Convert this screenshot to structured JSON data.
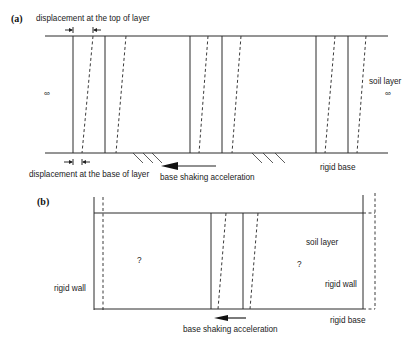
{
  "figure": {
    "panel_a": {
      "label": "(a)",
      "top_annotation": "displacement at the top of layer",
      "base_annotation": "displacement at the base of layer",
      "soil_layer_label": "soil layer",
      "infinity_left": "∞",
      "infinity_right": "∞",
      "arrow_label": "base shaking acceleration",
      "rigid_base_label": "rigid base",
      "columns": [
        {
          "solid_x": 73,
          "dash_top_x": 93,
          "dash_bottom_x": 82
        },
        {
          "solid_x": 105,
          "dash_top_x": 126,
          "dash_bottom_x": 116
        },
        {
          "solid_x": 190,
          "dash_top_x": 208,
          "dash_bottom_x": 199
        },
        {
          "solid_x": 222,
          "dash_top_x": 241,
          "dash_bottom_x": 232
        },
        {
          "solid_x": 316,
          "dash_top_x": 335,
          "dash_bottom_x": 325
        },
        {
          "solid_x": 348,
          "dash_top_x": 366,
          "dash_bottom_x": 357
        }
      ]
    },
    "panel_b": {
      "label": "(b)",
      "left_question": "?",
      "right_question": "?",
      "soil_layer_label": "soil layer",
      "left_wall_label": "rigid wall",
      "right_wall_label": "rigid wall",
      "arrow_label": "base shaking acceleration",
      "rigid_base_label": "rigid base"
    }
  }
}
